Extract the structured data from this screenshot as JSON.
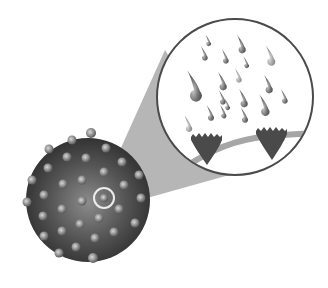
{
  "figure": {
    "type": "illustration",
    "colors": {
      "background": "#ffffff",
      "sphere_dark": "#3a3a3a",
      "sphere_light": "#8a8a8a",
      "receptor_dot": "#9a9a9a",
      "highlight_ring": "#e8e8e8",
      "cone": "#b4b4b4",
      "magnifier_border": "#4a4a4a",
      "droplet": "#6e6e6e",
      "receptor_cup": "#4c4c4c",
      "membrane": "#a8a8a8"
    },
    "sphere": {
      "cx": 88,
      "cy": 200,
      "r": 62
    },
    "highlight": {
      "cx": 104,
      "cy": 198,
      "r": 10
    },
    "magnifier": {
      "cx": 235,
      "cy": 97,
      "r": 78
    },
    "receptor_cups": 2,
    "droplet_count": 19
  }
}
